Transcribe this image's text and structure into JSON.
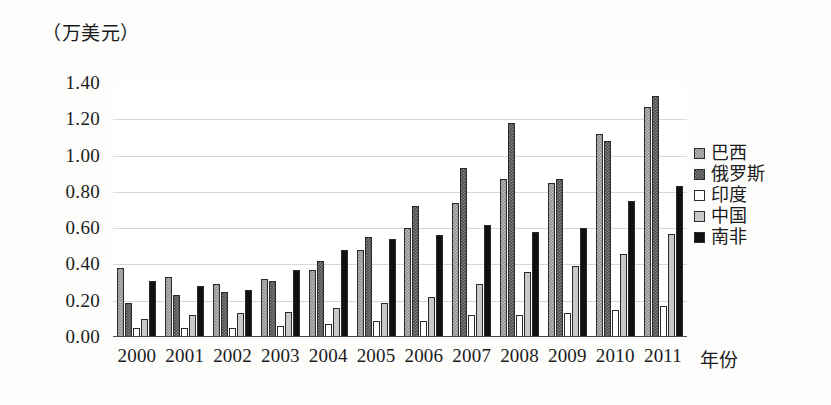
{
  "chart_data": {
    "type": "bar",
    "title": "",
    "subtitle": "",
    "unit_caption": "（万美元）",
    "xlabel": "年份",
    "ylabel": "",
    "ylim": [
      0.0,
      1.4
    ],
    "ytick_step": 0.2,
    "grid": true,
    "grid_axis": "y",
    "legend_position": "right",
    "orientation": "vertical",
    "grouping": "grouped",
    "categories": [
      "2000",
      "2001",
      "2002",
      "2003",
      "2004",
      "2005",
      "2006",
      "2007",
      "2008",
      "2009",
      "2010",
      "2011"
    ],
    "ytick_labels": [
      "1.40",
      "1.20",
      "1.00",
      "0.80",
      "0.60",
      "0.40",
      "0.20",
      "0.00"
    ],
    "ytick_values": [
      1.4,
      1.2,
      1.0,
      0.8,
      0.6,
      0.4,
      0.2,
      0.0
    ],
    "series": [
      {
        "name": "巴西",
        "color": "#8e8e8e",
        "pattern": "dotted-gray",
        "values": [
          0.38,
          0.33,
          0.29,
          0.32,
          0.37,
          0.48,
          0.6,
          0.74,
          0.87,
          0.85,
          1.12,
          1.27
        ]
      },
      {
        "name": "俄罗斯",
        "color": "#4d4d4d",
        "pattern": "dotted-dark",
        "values": [
          0.19,
          0.23,
          0.25,
          0.31,
          0.42,
          0.55,
          0.72,
          0.93,
          1.18,
          0.87,
          1.08,
          1.33
        ]
      },
      {
        "name": "印度",
        "color": "#ffffff",
        "pattern": "solid-white",
        "values": [
          0.05,
          0.05,
          0.05,
          0.06,
          0.07,
          0.09,
          0.09,
          0.12,
          0.12,
          0.13,
          0.15,
          0.17
        ]
      },
      {
        "name": "中国",
        "color": "#c9c9c9",
        "pattern": "solid-light-gray",
        "values": [
          0.1,
          0.12,
          0.13,
          0.14,
          0.16,
          0.19,
          0.22,
          0.29,
          0.36,
          0.39,
          0.46,
          0.57
        ]
      },
      {
        "name": "南非",
        "color": "#111111",
        "pattern": "solid-black",
        "values": [
          0.31,
          0.28,
          0.26,
          0.37,
          0.48,
          0.54,
          0.56,
          0.62,
          0.58,
          0.6,
          0.75,
          0.83
        ]
      }
    ]
  }
}
